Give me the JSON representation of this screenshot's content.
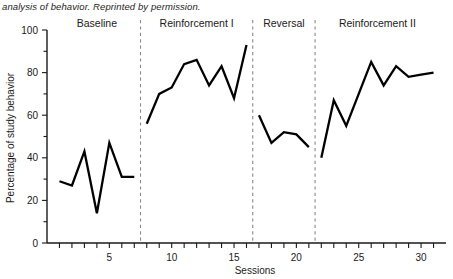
{
  "caption": "analysis of behavior. Reprinted by permission.",
  "chart_data": {
    "type": "line",
    "title": "",
    "xlabel": "Sessions",
    "ylabel": "Percentage of study behavior",
    "xlim": [
      0,
      32
    ],
    "ylim": [
      0,
      100
    ],
    "grid": false,
    "legend": "none",
    "y_ticks_major": [
      0,
      20,
      40,
      60,
      80,
      100
    ],
    "y_tick_labels": [
      "0",
      "20",
      "40",
      "60",
      "80",
      "100"
    ],
    "y_ticks_minor": [
      10,
      30,
      50,
      70,
      90
    ],
    "x_ticks": [
      1,
      2,
      3,
      4,
      5,
      6,
      7,
      8,
      9,
      10,
      11,
      12,
      13,
      14,
      15,
      16,
      17,
      18,
      19,
      20,
      21,
      22,
      23,
      24,
      25,
      26,
      27,
      28,
      29,
      30,
      31
    ],
    "x_tick_labels": [
      {
        "x": 5,
        "label": "5"
      },
      {
        "x": 10,
        "label": "10"
      },
      {
        "x": 15,
        "label": "15"
      },
      {
        "x": 20,
        "label": "20"
      },
      {
        "x": 25,
        "label": "25"
      },
      {
        "x": 30,
        "label": "30"
      }
    ],
    "phase_dividers": [
      7.5,
      16.5,
      21.5
    ],
    "phases": [
      {
        "name": "Baseline",
        "label_x": 4.0,
        "x_start": 1,
        "x_end": 7
      },
      {
        "name": "Reinforcement I",
        "label_x": 12.0,
        "x_start": 8,
        "x_end": 16
      },
      {
        "name": "Reversal",
        "label_x": 19.0,
        "x_start": 17,
        "x_end": 21
      },
      {
        "name": "Reinforcement II",
        "label_x": 26.5,
        "x_start": 22,
        "x_end": 31
      }
    ],
    "series": [
      {
        "name": "Study behavior",
        "segments": [
          {
            "phase": "Baseline",
            "x": [
              1,
              2,
              3,
              4,
              5,
              6,
              7
            ],
            "values": [
              29,
              27,
              43,
              14,
              47,
              31,
              31
            ]
          },
          {
            "phase": "Reinforcement I",
            "x": [
              8,
              9,
              10,
              11,
              12,
              13,
              14,
              15,
              16
            ],
            "values": [
              56,
              70,
              73,
              84,
              86,
              74,
              83,
              68,
              93
            ]
          },
          {
            "phase": "Reversal",
            "x": [
              17,
              18,
              19,
              20,
              21
            ],
            "values": [
              60,
              47,
              52,
              51,
              45
            ]
          },
          {
            "phase": "Reinforcement II",
            "x": [
              22,
              23,
              24,
              25,
              26,
              27,
              28,
              29,
              30,
              31
            ],
            "values": [
              40,
              67,
              55,
              70,
              85,
              74,
              83,
              78,
              79,
              80
            ]
          }
        ]
      }
    ]
  },
  "colors": {
    "line": "#000000",
    "axis": "#1a1a1a",
    "divider": "#8a8a8a",
    "background": "#ffffff"
  }
}
